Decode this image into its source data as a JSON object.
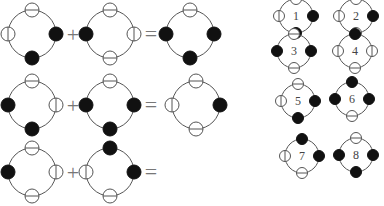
{
  "colors": {
    "ring": "#555555",
    "filled": "#111111",
    "empty": "#ffffff",
    "operator": "#777777",
    "label": "#444444"
  },
  "operators": {
    "plus": "+",
    "equals": "="
  },
  "equations": [
    {
      "row": 1,
      "terms": [
        {
          "slots": {
            "top": "empty",
            "right": "filled",
            "bottom": "filled",
            "left": "empty"
          }
        },
        {
          "slots": {
            "top": "empty",
            "right": "empty",
            "bottom": "empty",
            "left": "filled"
          }
        }
      ],
      "result": {
        "slots": {
          "top": "empty",
          "right": "filled",
          "bottom": "filled",
          "left": "filled"
        }
      }
    },
    {
      "row": 2,
      "terms": [
        {
          "slots": {
            "top": "empty",
            "right": "empty",
            "bottom": "filled",
            "left": "filled"
          }
        },
        {
          "slots": {
            "top": "empty",
            "right": "filled",
            "bottom": "filled",
            "left": "filled"
          }
        }
      ],
      "result": {
        "slots": {
          "top": "empty",
          "right": "filled",
          "bottom": "empty",
          "left": "empty"
        }
      }
    },
    {
      "row": 3,
      "terms": [
        {
          "slots": {
            "top": "empty",
            "right": "empty",
            "bottom": "empty",
            "left": "filled"
          }
        },
        {
          "slots": {
            "top": "filled",
            "right": "filled",
            "bottom": "empty",
            "left": "empty"
          }
        }
      ],
      "result": null
    }
  ],
  "options": [
    {
      "label": "1",
      "slots": {
        "top": "empty",
        "right": "filled",
        "bottom": "filled",
        "left": "empty"
      }
    },
    {
      "label": "2",
      "slots": {
        "top": "empty",
        "right": "filled",
        "bottom": "empty",
        "left": "empty"
      }
    },
    {
      "label": "3",
      "slots": {
        "top": "empty",
        "right": "filled",
        "bottom": "empty",
        "left": "filled"
      }
    },
    {
      "label": "4",
      "slots": {
        "top": "filled",
        "right": "empty",
        "bottom": "empty",
        "left": "empty"
      }
    },
    {
      "label": "5",
      "slots": {
        "top": "empty",
        "right": "filled",
        "bottom": "filled",
        "left": "empty"
      }
    },
    {
      "label": "6",
      "slots": {
        "top": "filled",
        "right": "filled",
        "bottom": "empty",
        "left": "filled"
      }
    },
    {
      "label": "7",
      "slots": {
        "top": "filled",
        "right": "filled",
        "bottom": "empty",
        "left": "empty"
      }
    },
    {
      "label": "8",
      "slots": {
        "top": "empty",
        "right": "filled",
        "bottom": "filled",
        "left": "filled"
      }
    }
  ]
}
